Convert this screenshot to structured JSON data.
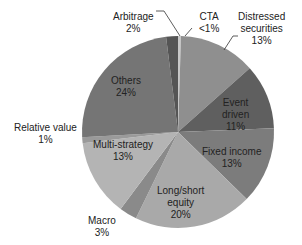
{
  "chart_data": {
    "type": "pie",
    "title": "",
    "start_angle_deg": -90,
    "direction": "clockwise",
    "slices": [
      {
        "label": "CTA",
        "display": "<1%",
        "value": 0.5,
        "color": "#c8c8c8"
      },
      {
        "label": "Distressed securities",
        "display": "13%",
        "value": 13,
        "color": "#8f8f8f"
      },
      {
        "label": "Event driven",
        "display": "11%",
        "value": 11,
        "color": "#5f5f5f"
      },
      {
        "label": "Fixed income",
        "display": "13%",
        "value": 13,
        "color": "#7c7c7c"
      },
      {
        "label": "Long/short equity",
        "display": "20%",
        "value": 20,
        "color": "#a9a9a9"
      },
      {
        "label": "Macro",
        "display": "3%",
        "value": 3,
        "color": "#8a8a8a"
      },
      {
        "label": "Multi-strategy",
        "display": "13%",
        "value": 13,
        "color": "#b4b4b4"
      },
      {
        "label": "Relative value",
        "display": "1%",
        "value": 1,
        "color": "#9a9a9a"
      },
      {
        "label": "Others",
        "display": "24%",
        "value": 24,
        "color": "#757575"
      },
      {
        "label": "Arbitrage",
        "display": "2%",
        "value": 2,
        "color": "#555555"
      }
    ]
  },
  "labels": {
    "arbitrage": {
      "name": "Arbitrage",
      "pct": "2%"
    },
    "cta": {
      "name": "CTA",
      "pct": "<1%"
    },
    "distressed": {
      "name1": "Distressed",
      "name2": "securities",
      "pct": "13%"
    },
    "event": {
      "name1": "Event",
      "name2": "driven",
      "pct": "11%"
    },
    "fixed": {
      "name": "Fixed income",
      "pct": "13%"
    },
    "longshort": {
      "name1": "Long/short",
      "name2": "equity",
      "pct": "20%"
    },
    "macro": {
      "name": "Macro",
      "pct": "3%"
    },
    "multi": {
      "name": "Multi-strategy",
      "pct": "13%"
    },
    "relative": {
      "name": "Relative value",
      "pct": "1%"
    },
    "others": {
      "name": "Others",
      "pct": "24%"
    }
  }
}
